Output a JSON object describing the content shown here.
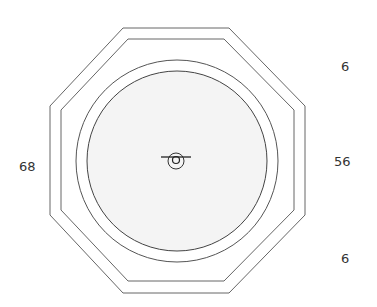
{
  "diagram": {
    "type": "octagonal-enclosure-top-view",
    "colors": {
      "stroke": "#555555",
      "fill": "#f4f4f4",
      "background": "#ffffff"
    },
    "labels": {
      "left_width": "68",
      "right_top_gap": "6",
      "right_middle": "56",
      "right_bottom_gap": "6"
    }
  }
}
